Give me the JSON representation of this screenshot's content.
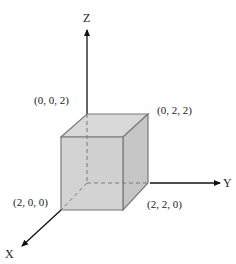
{
  "diagram": {
    "type": "3d-coordinate-cube",
    "axes": {
      "x": {
        "label": "X"
      },
      "y": {
        "label": "Y"
      },
      "z": {
        "label": "Z"
      }
    },
    "vertices": {
      "top_back": "(0, 0, 2)",
      "top_right": "(0, 2, 2)",
      "bottom_front": "(2, 0, 0)",
      "bottom_right": "(2, 2, 0)"
    },
    "colors": {
      "cube_fill_front": "#cfcfcf",
      "cube_fill_top": "#d9d9d9",
      "cube_fill_side": "#c4c4c4",
      "edge": "#7a7a7a",
      "axis": "#111111",
      "text": "#222222"
    }
  }
}
